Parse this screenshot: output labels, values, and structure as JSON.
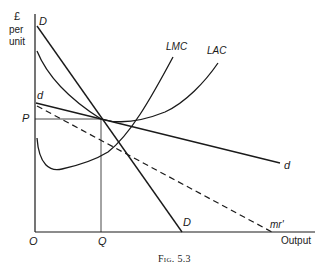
{
  "figure": {
    "caption": "Fig. 5.3",
    "y_axis_label_line1": "£",
    "y_axis_label_line2": "per",
    "y_axis_label_line3": "unit",
    "x_axis_label": "Output",
    "origin_label": "O",
    "price_label": "P",
    "quantity_label": "Q"
  },
  "curves": {
    "demand_D_top": "D",
    "demand_D_bottom": "D",
    "demand_d_left": "d",
    "demand_d_right": "d",
    "lmc": "LMC",
    "lac": "LAC",
    "mr": "mr'"
  },
  "colors": {
    "ink": "#1a1a1a",
    "background": "#ffffff"
  }
}
